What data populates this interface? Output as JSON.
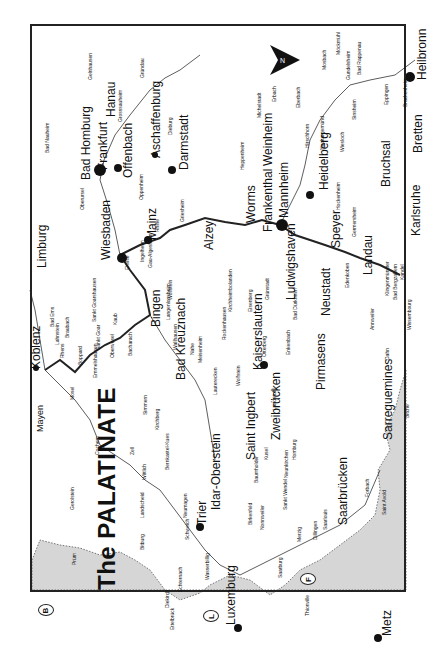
{
  "map": {
    "title": "The PALATINATE",
    "country_badges": [
      {
        "code": "B",
        "x": 38,
        "y": 606
      },
      {
        "code": "L",
        "x": 205,
        "y": 612
      },
      {
        "code": "F",
        "x": 303,
        "y": 575
      }
    ],
    "colors": {
      "foreign_land": "#d6d6d6",
      "border": "#222222",
      "river": "#333333",
      "land": "#ffffff"
    },
    "places": [
      {
        "name": "Bad Homburg",
        "x": 80,
        "y": 180,
        "size": "l"
      },
      {
        "name": "Frankfurt",
        "x": 97,
        "y": 170,
        "size": "l"
      },
      {
        "name": "Hanau",
        "x": 105,
        "y": 117,
        "size": "l"
      },
      {
        "name": "Offenbach",
        "x": 122,
        "y": 178,
        "size": "l"
      },
      {
        "name": "Aschaffenburg",
        "x": 150,
        "y": 158,
        "size": "l"
      },
      {
        "name": "Darmstadt",
        "x": 178,
        "y": 170,
        "size": "l"
      },
      {
        "name": "Wiesbaden",
        "x": 100,
        "y": 260,
        "size": "l"
      },
      {
        "name": "Mainz",
        "x": 146,
        "y": 240,
        "size": "l"
      },
      {
        "name": "Limburg",
        "x": 36,
        "y": 268,
        "size": "l"
      },
      {
        "name": "Koblenz",
        "x": 30,
        "y": 369,
        "size": "l"
      },
      {
        "name": "Mayen",
        "x": 36,
        "y": 432,
        "size": "m"
      },
      {
        "name": "Bingen",
        "x": 150,
        "y": 327,
        "size": "l"
      },
      {
        "name": "Bad Kreuznach",
        "x": 175,
        "y": 380,
        "size": "l"
      },
      {
        "name": "Alzey",
        "x": 203,
        "y": 250,
        "size": "l"
      },
      {
        "name": "Worms",
        "x": 245,
        "y": 223,
        "size": "l"
      },
      {
        "name": "Frankenthal",
        "x": 262,
        "y": 232,
        "size": "l"
      },
      {
        "name": "Mannheim",
        "x": 278,
        "y": 218,
        "size": "l"
      },
      {
        "name": "Weinheim",
        "x": 262,
        "y": 166,
        "size": "l"
      },
      {
        "name": "Heidelberg",
        "x": 318,
        "y": 190,
        "size": "l"
      },
      {
        "name": "Ludwigshaven",
        "x": 285,
        "y": 300,
        "size": "l"
      },
      {
        "name": "Speyer",
        "x": 330,
        "y": 248,
        "size": "l"
      },
      {
        "name": "Neustadt",
        "x": 320,
        "y": 316,
        "size": "l"
      },
      {
        "name": "Landau",
        "x": 362,
        "y": 275,
        "size": "l"
      },
      {
        "name": "Karlsruhe",
        "x": 410,
        "y": 236,
        "size": "l"
      },
      {
        "name": "Bruchsal",
        "x": 380,
        "y": 187,
        "size": "l"
      },
      {
        "name": "Bretten",
        "x": 412,
        "y": 153,
        "size": "l"
      },
      {
        "name": "Heilbronn",
        "x": 416,
        "y": 80,
        "size": "l"
      },
      {
        "name": "Kaiserslautern",
        "x": 252,
        "y": 370,
        "size": "l"
      },
      {
        "name": "Pirmasens",
        "x": 315,
        "y": 390,
        "size": "l"
      },
      {
        "name": "Zweibrücken",
        "x": 270,
        "y": 440,
        "size": "l"
      },
      {
        "name": "Saint Ingbert",
        "x": 245,
        "y": 460,
        "size": "l"
      },
      {
        "name": "Saarbrücken",
        "x": 337,
        "y": 525,
        "size": "l"
      },
      {
        "name": "Sarreguemines",
        "x": 382,
        "y": 440,
        "size": "l"
      },
      {
        "name": "Idar-Oberstein",
        "x": 210,
        "y": 510,
        "size": "l"
      },
      {
        "name": "Trier",
        "x": 196,
        "y": 525,
        "size": "l"
      },
      {
        "name": "Luxemburg",
        "x": 225,
        "y": 625,
        "size": "l"
      },
      {
        "name": "Metz",
        "x": 381,
        "y": 636,
        "size": "l"
      }
    ],
    "small_places": [
      {
        "name": "Gelnhausen",
        "x": 88,
        "y": 80
      },
      {
        "name": "Gründau",
        "x": 140,
        "y": 78
      },
      {
        "name": "Grosssauheim",
        "x": 118,
        "y": 122
      },
      {
        "name": "Bad Nauheim",
        "x": 45,
        "y": 153
      },
      {
        "name": "Dieburg",
        "x": 168,
        "y": 135
      },
      {
        "name": "Oberursel",
        "x": 80,
        "y": 210
      },
      {
        "name": "Oppenheim",
        "x": 139,
        "y": 200
      },
      {
        "name": "Griesheim",
        "x": 180,
        "y": 222
      },
      {
        "name": "Michelstadt",
        "x": 257,
        "y": 118
      },
      {
        "name": "Erbach",
        "x": 272,
        "y": 102
      },
      {
        "name": "Heppenheim",
        "x": 240,
        "y": 170
      },
      {
        "name": "Eberbach",
        "x": 296,
        "y": 108
      },
      {
        "name": "Hirschhorn",
        "x": 305,
        "y": 148
      },
      {
        "name": "Neckargemünd",
        "x": 320,
        "y": 150
      },
      {
        "name": "Mosbach",
        "x": 322,
        "y": 70
      },
      {
        "name": "Möckmühl",
        "x": 336,
        "y": 55
      },
      {
        "name": "Gundelsheim",
        "x": 346,
        "y": 80
      },
      {
        "name": "Bad Rappenau",
        "x": 357,
        "y": 75
      },
      {
        "name": "Hockenheim",
        "x": 336,
        "y": 210
      },
      {
        "name": "Germersheim",
        "x": 352,
        "y": 237
      },
      {
        "name": "Sinsheim",
        "x": 352,
        "y": 120
      },
      {
        "name": "Eppingen",
        "x": 384,
        "y": 105
      },
      {
        "name": "Brackenheim",
        "x": 403,
        "y": 107
      },
      {
        "name": "Wiesloch",
        "x": 340,
        "y": 152
      },
      {
        "name": "Kandel",
        "x": 400,
        "y": 280
      },
      {
        "name": "Wissembourg",
        "x": 407,
        "y": 330
      },
      {
        "name": "Bad Bergzabern",
        "x": 393,
        "y": 300
      },
      {
        "name": "Klingenmünster",
        "x": 385,
        "y": 296
      },
      {
        "name": "Annweiler",
        "x": 370,
        "y": 330
      },
      {
        "name": "Dahn",
        "x": 385,
        "y": 360
      },
      {
        "name": "Bitche",
        "x": 405,
        "y": 418
      },
      {
        "name": "Edenkoben",
        "x": 345,
        "y": 288
      },
      {
        "name": "Bad Dürkheim",
        "x": 293,
        "y": 320
      },
      {
        "name": "Grünstadt",
        "x": 265,
        "y": 300
      },
      {
        "name": "Eisenberg",
        "x": 248,
        "y": 312
      },
      {
        "name": "Kirchheimbolanden",
        "x": 228,
        "y": 312
      },
      {
        "name": "Rockenhausen",
        "x": 222,
        "y": 340
      },
      {
        "name": "Lauterecken",
        "x": 213,
        "y": 395
      },
      {
        "name": "Wolfstein",
        "x": 236,
        "y": 386
      },
      {
        "name": "Otterberg",
        "x": 262,
        "y": 357
      },
      {
        "name": "Enkenbach",
        "x": 286,
        "y": 355
      },
      {
        "name": "Landstuhl",
        "x": 272,
        "y": 410
      },
      {
        "name": "Homburg",
        "x": 292,
        "y": 460
      },
      {
        "name": "Neunkirchen",
        "x": 284,
        "y": 478
      },
      {
        "name": "Sankt Wendel",
        "x": 283,
        "y": 510
      },
      {
        "name": "Birkenfeld",
        "x": 248,
        "y": 525
      },
      {
        "name": "Baumholder",
        "x": 254,
        "y": 483
      },
      {
        "name": "Kusel",
        "x": 264,
        "y": 460
      },
      {
        "name": "Merzig",
        "x": 297,
        "y": 542
      },
      {
        "name": "Saarlouis",
        "x": 323,
        "y": 530
      },
      {
        "name": "Dillingen",
        "x": 313,
        "y": 540
      },
      {
        "name": "Saarburg",
        "x": 278,
        "y": 578
      },
      {
        "name": "Nonnweiler",
        "x": 260,
        "y": 530
      },
      {
        "name": "Saint Avold",
        "x": 382,
        "y": 515
      },
      {
        "name": "Forbach",
        "x": 365,
        "y": 497
      },
      {
        "name": "Thionville",
        "x": 305,
        "y": 616
      },
      {
        "name": "Wittlich",
        "x": 142,
        "y": 480
      },
      {
        "name": "Bernkastel-Kues",
        "x": 165,
        "y": 470
      },
      {
        "name": "Neumagen",
        "x": 183,
        "y": 518
      },
      {
        "name": "Schweich",
        "x": 185,
        "y": 540
      },
      {
        "name": "Bitburg",
        "x": 140,
        "y": 550
      },
      {
        "name": "Landscheid",
        "x": 140,
        "y": 518
      },
      {
        "name": "Gerolstein",
        "x": 70,
        "y": 510
      },
      {
        "name": "Prüm",
        "x": 72,
        "y": 565
      },
      {
        "name": "Cochem",
        "x": 95,
        "y": 455
      },
      {
        "name": "Zell",
        "x": 130,
        "y": 455
      },
      {
        "name": "Simmern",
        "x": 143,
        "y": 415
      },
      {
        "name": "Kirchberg",
        "x": 155,
        "y": 430
      },
      {
        "name": "Bacharach",
        "x": 128,
        "y": 356
      },
      {
        "name": "Oberwesel",
        "x": 110,
        "y": 358
      },
      {
        "name": "Kaub",
        "x": 113,
        "y": 325
      },
      {
        "name": "Sankt Goarshausen",
        "x": 92,
        "y": 322
      },
      {
        "name": "Sankt Goar",
        "x": 96,
        "y": 350
      },
      {
        "name": "Boppard",
        "x": 78,
        "y": 365
      },
      {
        "name": "Rhens",
        "x": 60,
        "y": 358
      },
      {
        "name": "Lahnstein",
        "x": 55,
        "y": 345
      },
      {
        "name": "Braubach",
        "x": 65,
        "y": 338
      },
      {
        "name": "Bad Ems",
        "x": 50,
        "y": 327
      },
      {
        "name": "Emmelshausen",
        "x": 93,
        "y": 378
      },
      {
        "name": "Eltville",
        "x": 125,
        "y": 270
      },
      {
        "name": "Ingelheim",
        "x": 140,
        "y": 262
      },
      {
        "name": "Gau-Algesheim",
        "x": 148,
        "y": 268
      },
      {
        "name": "Langenlonsheim",
        "x": 166,
        "y": 320
      },
      {
        "name": "Wallhausen",
        "x": 173,
        "y": 350
      },
      {
        "name": "Wöllstein",
        "x": 168,
        "y": 300
      },
      {
        "name": "Meisenheim",
        "x": 198,
        "y": 363
      },
      {
        "name": "Rhine",
        "x": 155,
        "y": 232
      },
      {
        "name": "Nahe",
        "x": 190,
        "y": 355
      },
      {
        "name": "Mosel",
        "x": 70,
        "y": 400
      },
      {
        "name": "Echternach",
        "x": 178,
        "y": 592
      },
      {
        "name": "Wasserbillig",
        "x": 205,
        "y": 580
      },
      {
        "name": "Diekirch",
        "x": 165,
        "y": 608
      },
      {
        "name": "Ettelbrück",
        "x": 170,
        "y": 630
      }
    ]
  }
}
